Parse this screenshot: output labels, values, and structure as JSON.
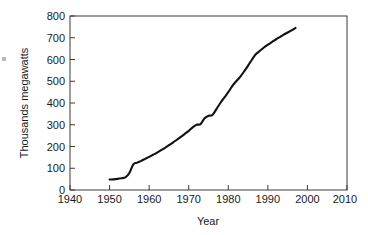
{
  "chart_data": {
    "type": "line",
    "title": "",
    "xlabel": "Year",
    "ylabel": "Thousands megawatts",
    "xlim": [
      1940,
      2010
    ],
    "ylim": [
      0,
      800
    ],
    "grid": false,
    "legend": null,
    "xticks": [
      1940,
      1950,
      1960,
      1970,
      1980,
      1990,
      2000,
      2010
    ],
    "yticks": [
      0,
      100,
      200,
      300,
      400,
      500,
      600,
      700,
      800
    ],
    "series": [
      {
        "name": "Installed capacity",
        "x": [
          1950,
          1951,
          1952,
          1953,
          1954,
          1955,
          1956,
          1957,
          1958,
          1959,
          1960,
          1961,
          1962,
          1963,
          1964,
          1965,
          1966,
          1967,
          1968,
          1969,
          1970,
          1971,
          1972,
          1973,
          1974,
          1975,
          1976,
          1977,
          1978,
          1979,
          1980,
          1981,
          1982,
          1983,
          1984,
          1985,
          1986,
          1987,
          1988,
          1989,
          1990,
          1991,
          1992,
          1993,
          1994,
          1995,
          1996,
          1997
        ],
        "values": [
          48,
          49,
          51,
          54,
          58,
          78,
          118,
          126,
          134,
          143,
          152,
          162,
          172,
          183,
          194,
          206,
          218,
          231,
          244,
          258,
          272,
          288,
          300,
          303,
          330,
          341,
          345,
          372,
          400,
          425,
          450,
          478,
          500,
          520,
          545,
          572,
          600,
          625,
          640,
          655,
          668,
          680,
          692,
          703,
          714,
          724,
          734,
          745
        ]
      }
    ]
  },
  "axes": {
    "x_tick_labels": [
      "1940",
      "1950",
      "1960",
      "1970",
      "1980",
      "1990",
      "2000",
      "2010"
    ],
    "y_tick_labels": [
      "0",
      "100",
      "200",
      "300",
      "400",
      "500",
      "600",
      "700",
      "800"
    ],
    "x_axis_title": "Year",
    "y_axis_title": "Thousands megawatts"
  },
  "colors": {
    "line": "#111111",
    "frame": "#3a3a3a",
    "text": "#1a1a1a",
    "background": "#ffffff"
  }
}
